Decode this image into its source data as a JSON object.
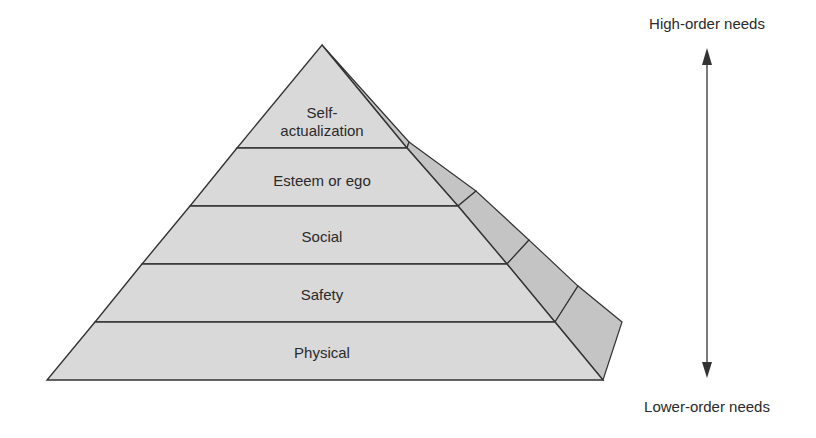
{
  "diagram": {
    "type": "pyramid",
    "layers": [
      {
        "label_lines": [
          "Self-",
          "actualization"
        ]
      },
      {
        "label_lines": [
          "Esteem or ego"
        ]
      },
      {
        "label_lines": [
          "Social"
        ]
      },
      {
        "label_lines": [
          "Safety"
        ]
      },
      {
        "label_lines": [
          "Physical"
        ]
      }
    ],
    "axis": {
      "top_label": "High-order needs",
      "bottom_label": "Lower-order needs"
    },
    "colors": {
      "front_face": "#d9d9d9",
      "side_face": "#c4c4c4",
      "stroke": "#333333",
      "text": "#2a2a2a"
    }
  }
}
